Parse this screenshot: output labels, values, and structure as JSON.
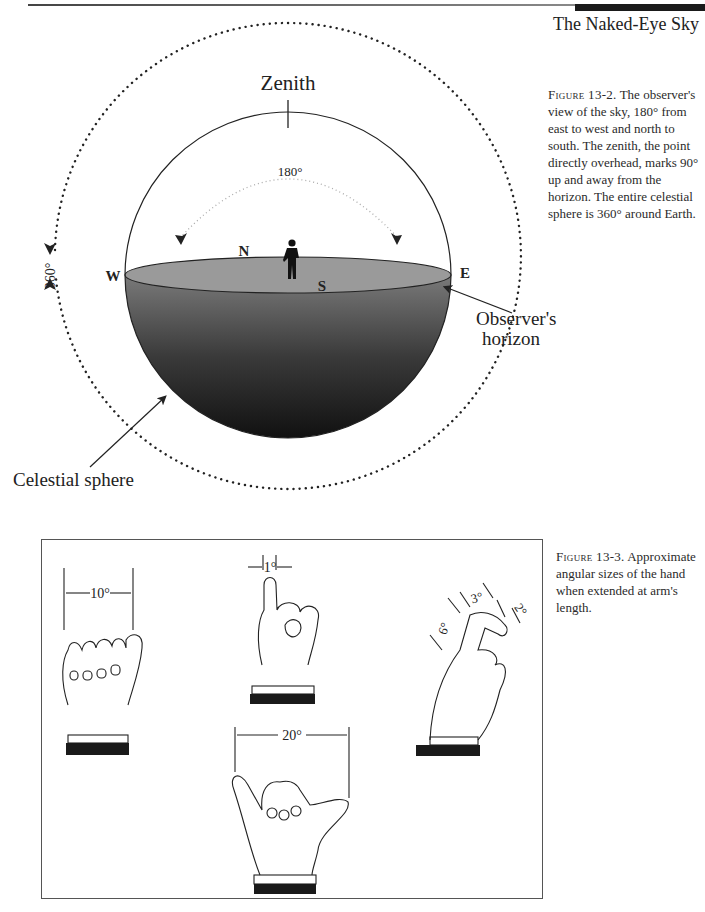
{
  "header": {
    "running_head": "The Naked-Eye Sky"
  },
  "figure_13_2": {
    "caption_label": "Figure 13-2.",
    "caption_text": "The observer's view of the sky, 180° from east to west and north to south. The zenith, the point directly overhead, marks 90° up and away from the horizon. The entire celestial sphere is 360° around Earth.",
    "labels": {
      "zenith": "Zenith",
      "arc_180": "180°",
      "arc_360": "360°",
      "north": "N",
      "south": "S",
      "west": "W",
      "east": "E",
      "observers_horizon_line1": "Observer's",
      "observers_horizon_line2": "horizon",
      "celestial_sphere": "Celestial sphere"
    }
  },
  "figure_13_3": {
    "caption_label": "Figure 13-3.",
    "caption_text": "Approximate angular sizes of the hand when extended at arm's length.",
    "hands": [
      {
        "name": "fist",
        "label": "10°"
      },
      {
        "name": "little-finger",
        "label": "1°"
      },
      {
        "name": "spread-hand",
        "label": "20°"
      },
      {
        "name": "index-finger-segments",
        "labels": [
          "6°",
          "3°",
          "2°"
        ]
      }
    ]
  }
}
